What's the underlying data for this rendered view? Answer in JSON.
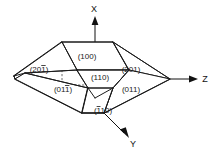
{
  "diagram": {
    "background_color": "#ffffff",
    "line_color": "#1c1c1c",
    "hidden_line_color": "#4a4a4a"
  },
  "axes": [
    {
      "name": "x-axis",
      "label": "X",
      "direction": "up",
      "label_x": 94,
      "label_y": 12
    },
    {
      "name": "z-axis",
      "label": "Z",
      "direction": "right",
      "label_x": 205,
      "label_y": 81
    },
    {
      "name": "y-axis",
      "label": "Y",
      "direction": "down-right",
      "label_x": 133,
      "label_y": 146
    }
  ],
  "faces": [
    {
      "name": "face-100",
      "label": "(100)",
      "digits": "100",
      "bar_over": "none",
      "label_x": 87,
      "label_y": 59
    },
    {
      "name": "face-201-bar",
      "label": "(20̈1)",
      "digits": "201",
      "bar_over": "last",
      "label_x": 39,
      "label_y": 72
    },
    {
      "name": "face-201",
      "label": "(201)",
      "digits": "201",
      "bar_over": "none",
      "label_x": 131,
      "label_y": 72
    },
    {
      "name": "face-110-upper",
      "label": "(110)",
      "digits": "110",
      "bar_over": "none",
      "label_x": 100,
      "label_y": 80
    },
    {
      "name": "face-011-bar",
      "label": "(011)",
      "digits": "011",
      "bar_over": "last",
      "label_x": 63,
      "label_y": 92
    },
    {
      "name": "face-011",
      "label": "(011)",
      "digits": "011",
      "bar_over": "none",
      "label_x": 131,
      "label_y": 92
    },
    {
      "name": "face-110-lower",
      "label": "(110)",
      "digits": "110",
      "bar_over": "first",
      "label_x": 103,
      "label_y": 113
    }
  ]
}
